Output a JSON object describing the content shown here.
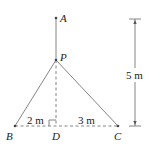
{
  "diagram": {
    "points": {
      "A": {
        "label": "A",
        "x": 56,
        "y": 18
      },
      "P": {
        "label": "P",
        "x": 56,
        "y": 60
      },
      "B": {
        "label": "B",
        "x": 15,
        "y": 126
      },
      "D": {
        "label": "D",
        "x": 56,
        "y": 126
      },
      "C": {
        "label": "C",
        "x": 118,
        "y": 126
      }
    },
    "dimensions": {
      "BD": "2 m",
      "DC": "3 m",
      "height": "5 m"
    },
    "colors": {
      "line": "#777777",
      "text": "#222222",
      "background": "#ffffff"
    }
  }
}
